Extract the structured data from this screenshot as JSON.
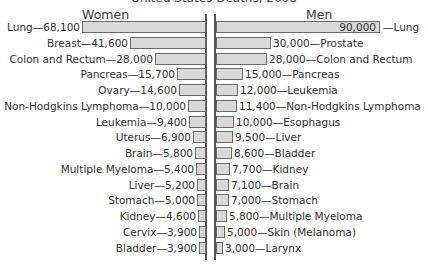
{
  "chart_data": {
    "type": "bar",
    "orientation": "horizontal-back-to-back",
    "title": "United States Deaths, 2008",
    "xlabel": "",
    "ylabel": "",
    "grid": false,
    "legend": null,
    "series": [
      {
        "name": "Women",
        "side": "left",
        "categories": [
          "Lung",
          "Breast",
          "Colon and Rectum",
          "Pancreas",
          "Ovary",
          "Non-Hodgkins Lymphoma",
          "Leukemia",
          "Uterus",
          "Brain",
          "Multiple Myeloma",
          "Liver",
          "Stomach",
          "Kidney",
          "Cervix",
          "Bladder"
        ],
        "values": [
          68100,
          41600,
          28000,
          15700,
          14600,
          10000,
          9400,
          6900,
          5800,
          5400,
          5200,
          5000,
          4600,
          3900,
          3900
        ],
        "labels": [
          "Lung—68,100",
          "Breast—41,600",
          "Colon and Rectum—28,000",
          "Pancreas—15,700",
          "Ovary—14,600",
          "Non-Hodgkins Lymphoma—10,000",
          "Leukemia—9,400",
          "Uterus—6,900",
          "Brain—5,800",
          "Multiple Myeloma—5,400",
          "Liver—5,200",
          "Stomach—5,000",
          "Kidney—4,600",
          "Cervix—3,900",
          "Bladder—3,900"
        ]
      },
      {
        "name": "Men",
        "side": "right",
        "categories": [
          "Lung",
          "Prostate",
          "Colon and Rectum",
          "Pancreas",
          "Leukemia",
          "Non-Hodgkins Lymphoma",
          "Esophagus",
          "Liver",
          "Bladder",
          "Kidney",
          "Brain",
          "Stomach",
          "Multiple Myeloma",
          "Skin (Melanoma)",
          "Larynx"
        ],
        "values": [
          90000,
          30000,
          28000,
          15000,
          12000,
          11400,
          10000,
          9500,
          8600,
          7700,
          7100,
          7000,
          5800,
          5000,
          3000
        ],
        "labels": [
          "90,000",
          "30,000—Prostate",
          "28,000—Colon and Rectum",
          "15,000—Pancreas",
          "12,000—Leukemia",
          "11,400—Non-Hodgkins Lymphoma",
          "10,000—Esophagus",
          "9,500—Liver",
          "8,600—Bladder",
          "7,700—Kidney",
          "7,100—Brain",
          "7,000—Stomach",
          "5,800—Multiple Myeloma",
          "5,000—Skin (Melanoma)",
          "3,000—Larynx"
        ],
        "first_label_outside": "—Lung"
      }
    ],
    "colors": {
      "bar_fill": "#d9d9d9",
      "bar_border": "#6a6a6a",
      "axis": "#555555"
    }
  },
  "header": {
    "title": "United States Deaths, 2008",
    "women": "Women",
    "men": "Men"
  }
}
